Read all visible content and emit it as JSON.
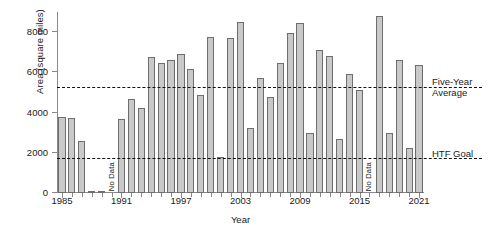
{
  "chart_data": {
    "type": "bar",
    "title": "",
    "xlabel": "Year",
    "ylabel": "Area (square miles)",
    "ylim": [
      0,
      9000
    ],
    "yticks": [
      0,
      2000,
      4000,
      6000,
      8000
    ],
    "ytick_labels": [
      "0",
      "2000",
      "4000",
      "6000",
      "8000"
    ],
    "xlim": [
      1984.5,
      2021.5
    ],
    "xtick_labels": [
      "1985",
      "1991",
      "1997",
      "2003",
      "2009",
      "2015",
      "2021"
    ],
    "xticks": [
      1985,
      1991,
      1997,
      2003,
      2009,
      2015,
      2021
    ],
    "grid": false,
    "legend": "none",
    "bar_color": "#c9c9c9",
    "bar_edge_color": "#6e6e6e",
    "categories": [
      1985,
      1986,
      1987,
      1988,
      1989,
      1990,
      1991,
      1992,
      1993,
      1994,
      1995,
      1996,
      1997,
      1998,
      1999,
      2000,
      2001,
      2002,
      2003,
      2004,
      2005,
      2006,
      2007,
      2008,
      2009,
      2010,
      2011,
      2012,
      2013,
      2014,
      2015,
      2016,
      2017,
      2018,
      2019,
      2020,
      2021
    ],
    "values": [
      3800,
      3750,
      2600,
      60,
      0,
      null,
      3700,
      4650,
      4250,
      6750,
      6450,
      6600,
      6900,
      6150,
      4850,
      7750,
      1800,
      7700,
      8500,
      3250,
      5700,
      4750,
      6450,
      7950,
      8450,
      3000,
      7100,
      6800,
      2700,
      5900,
      5100,
      null,
      8800,
      3000,
      6600,
      2250,
      6350
    ],
    "missing_label": "No Data",
    "missing_years": [
      1990,
      2016
    ],
    "reference_lines": [
      {
        "name": "five-year-average",
        "label": "Five-Year\nAverage",
        "label_line1": "Five-Year",
        "label_line2": "Average",
        "value": 5200,
        "style": "dashed"
      },
      {
        "name": "htf-goal",
        "label": "HTF Goal",
        "label_line1": "HTF Goal",
        "label_line2": "",
        "value": 1700,
        "style": "dashed"
      }
    ]
  }
}
